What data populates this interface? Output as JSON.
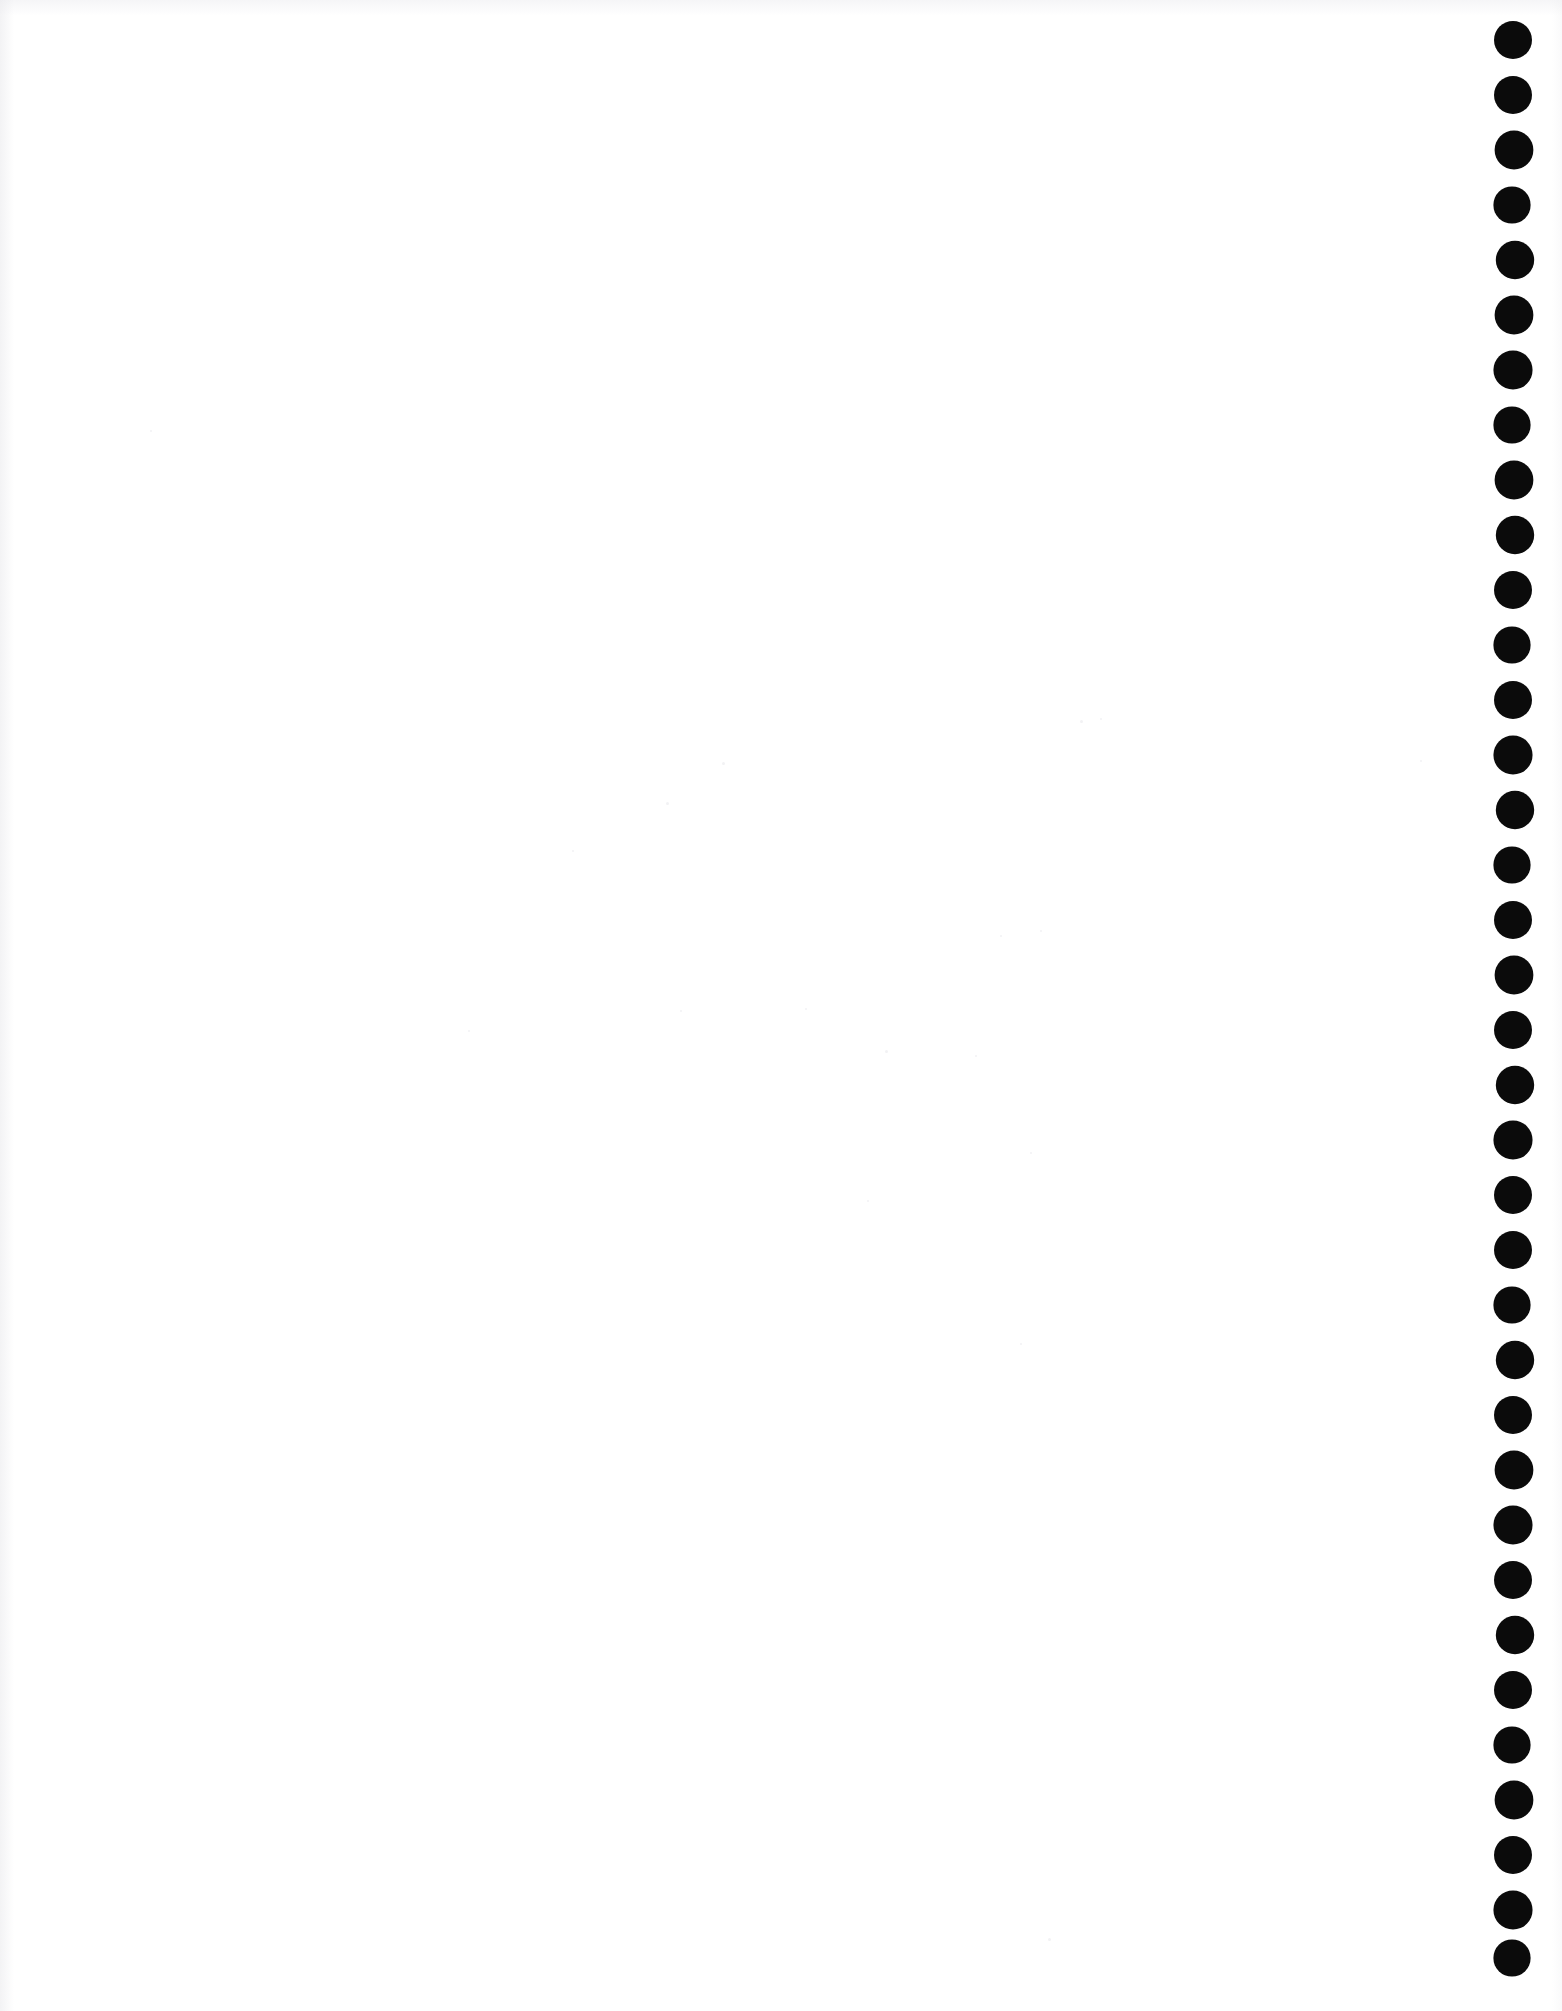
{
  "page": {
    "width_px": 1562,
    "height_px": 2011,
    "background_color": "#ffffff",
    "body_text": "",
    "content_note": ""
  },
  "binding_column": {
    "label": "binding hole column",
    "icon_name": "filled-circle-icon",
    "dot_color": "#0b0b0b",
    "dot_count": 36,
    "dot_diameter_px": 38,
    "dot_spacing_px": 55,
    "first_dot_center_y_px": 40,
    "last_dot_center_y_px": 1958,
    "center_x_px": 1519,
    "dots": [
      {
        "index": 1,
        "center_y": 40
      },
      {
        "index": 2,
        "center_y": 95
      },
      {
        "index": 3,
        "center_y": 150
      },
      {
        "index": 4,
        "center_y": 205
      },
      {
        "index": 5,
        "center_y": 260
      },
      {
        "index": 6,
        "center_y": 315
      },
      {
        "index": 7,
        "center_y": 370
      },
      {
        "index": 8,
        "center_y": 425
      },
      {
        "index": 9,
        "center_y": 480
      },
      {
        "index": 10,
        "center_y": 535
      },
      {
        "index": 11,
        "center_y": 590
      },
      {
        "index": 12,
        "center_y": 645
      },
      {
        "index": 13,
        "center_y": 700
      },
      {
        "index": 14,
        "center_y": 755
      },
      {
        "index": 15,
        "center_y": 810
      },
      {
        "index": 16,
        "center_y": 865
      },
      {
        "index": 17,
        "center_y": 920
      },
      {
        "index": 18,
        "center_y": 975
      },
      {
        "index": 19,
        "center_y": 1030
      },
      {
        "index": 20,
        "center_y": 1085
      },
      {
        "index": 21,
        "center_y": 1140
      },
      {
        "index": 22,
        "center_y": 1195
      },
      {
        "index": 23,
        "center_y": 1250
      },
      {
        "index": 24,
        "center_y": 1305
      },
      {
        "index": 25,
        "center_y": 1360
      },
      {
        "index": 26,
        "center_y": 1415
      },
      {
        "index": 27,
        "center_y": 1470
      },
      {
        "index": 28,
        "center_y": 1525
      },
      {
        "index": 29,
        "center_y": 1580
      },
      {
        "index": 30,
        "center_y": 1635
      },
      {
        "index": 31,
        "center_y": 1690
      },
      {
        "index": 32,
        "center_y": 1745
      },
      {
        "index": 33,
        "center_y": 1800
      },
      {
        "index": 34,
        "center_y": 1855
      },
      {
        "index": 35,
        "center_y": 1910
      },
      {
        "index": 36,
        "center_y": 1958
      }
    ]
  },
  "scan_artifacts": {
    "label": "scanner speckles",
    "specks": [
      {
        "x": 666,
        "y": 802,
        "size": 3
      },
      {
        "x": 722,
        "y": 762,
        "size": 3
      },
      {
        "x": 1080,
        "y": 720,
        "size": 3
      },
      {
        "x": 1100,
        "y": 718,
        "size": 2
      },
      {
        "x": 885,
        "y": 1050,
        "size": 3
      },
      {
        "x": 975,
        "y": 1055,
        "size": 2
      },
      {
        "x": 572,
        "y": 850,
        "size": 2
      },
      {
        "x": 1040,
        "y": 930,
        "size": 2
      },
      {
        "x": 680,
        "y": 1010,
        "size": 2
      },
      {
        "x": 1000,
        "y": 935,
        "size": 2
      },
      {
        "x": 867,
        "y": 1200,
        "size": 2
      },
      {
        "x": 1048,
        "y": 1938,
        "size": 3
      },
      {
        "x": 468,
        "y": 1030,
        "size": 2
      },
      {
        "x": 1020,
        "y": 1343,
        "size": 2
      },
      {
        "x": 150,
        "y": 430,
        "size": 2
      },
      {
        "x": 1420,
        "y": 760,
        "size": 2
      },
      {
        "x": 805,
        "y": 1008,
        "size": 2
      },
      {
        "x": 1030,
        "y": 1152,
        "size": 2
      }
    ]
  }
}
